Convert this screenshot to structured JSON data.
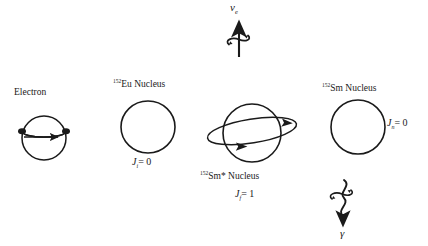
{
  "figure": {
    "background_color": "#ffffff",
    "stroke_color": "#1a1a1a",
    "text_color": "#1a1a1a"
  },
  "electron": {
    "label": "Electron"
  },
  "neutrino": {
    "symbol": "ν",
    "subscript": "e"
  },
  "eu_nucleus": {
    "mass_number": "152",
    "symbol": "Eu Nucleus",
    "spin_symbol": "J",
    "spin_subscript": "i",
    "spin_equals": "= 0"
  },
  "sm_excited_nucleus": {
    "mass_number": "152",
    "symbol": "Sm* Nucleus",
    "spin_symbol": "J",
    "spin_subscript": "f",
    "spin_equals": "= 1"
  },
  "sm_nucleus": {
    "mass_number": "152",
    "symbol": "Sm Nucleus",
    "spin_symbol": "J",
    "spin_subscript": "n",
    "spin_equals": "= 0"
  },
  "gamma": {
    "symbol": "γ"
  }
}
